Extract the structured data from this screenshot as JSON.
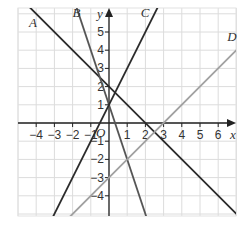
{
  "chart_data": {
    "type": "line",
    "title": "",
    "xlabel": "x",
    "ylabel": "y",
    "origin_label": "O",
    "xlim": [
      -5,
      7
    ],
    "ylim": [
      -5,
      6.3
    ],
    "grid": true,
    "x_ticks": [
      -4,
      -3,
      -2,
      -1,
      1,
      2,
      3,
      4,
      5,
      6
    ],
    "y_ticks": [
      -4,
      -3,
      -2,
      -1,
      1,
      2,
      3,
      4,
      5
    ],
    "x_tick_labels": [
      "−4",
      "−3",
      "−2",
      "−1",
      "1",
      "2",
      "3",
      "4",
      "5",
      "6"
    ],
    "y_tick_labels": [
      "−4",
      "−3",
      "−2",
      "−1",
      "1",
      "2",
      "3",
      "4",
      "5"
    ],
    "series": [
      {
        "name": "A",
        "equation": "y = -x + 2",
        "slope": -1,
        "intercept": 2,
        "color": "#2b2b2b",
        "label_pos": [
          -4.4,
          5.3
        ]
      },
      {
        "name": "B",
        "equation": "y = -3x + 1",
        "slope": -3,
        "intercept": 1,
        "color": "#555555",
        "label_pos": [
          -2.0,
          5.8
        ]
      },
      {
        "name": "C",
        "equation": "y = 2x + 1",
        "slope": 2,
        "intercept": 1,
        "color": "#2b2b2b",
        "label_pos": [
          1.75,
          5.8
        ]
      },
      {
        "name": "D",
        "equation": "y = x - 3",
        "slope": 1,
        "intercept": -3,
        "color": "#a0a0a0",
        "label_pos": [
          6.5,
          4.5
        ]
      }
    ]
  }
}
